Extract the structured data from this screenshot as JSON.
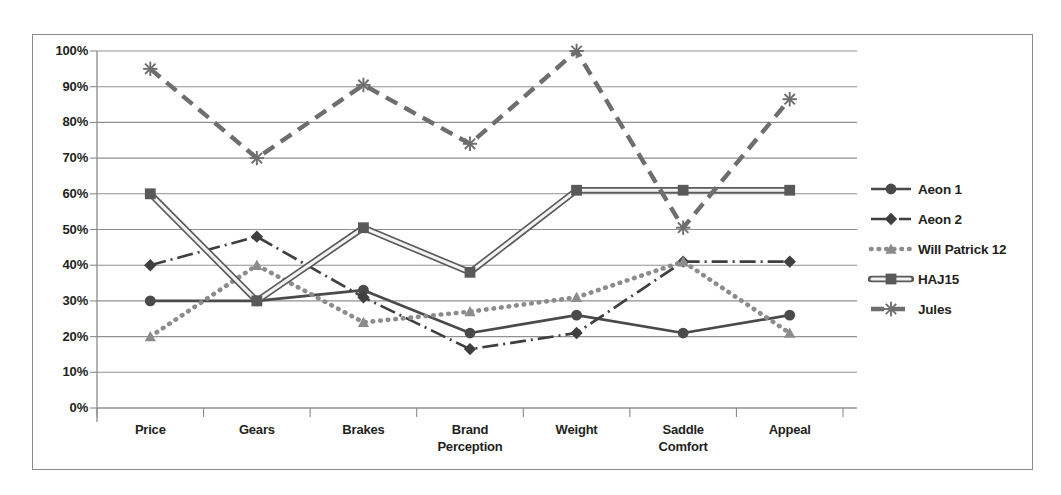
{
  "chart_data": {
    "type": "line",
    "title": "",
    "xlabel": "",
    "ylabel": "",
    "ylim": [
      0,
      100
    ],
    "grid": true,
    "legend_position": "right",
    "categories": [
      "Price",
      "Gears",
      "Brakes",
      "Brand\nPerception",
      "Weight",
      "Saddle\nComfort",
      "Appeal"
    ],
    "ytick_labels": [
      "100%",
      "90%",
      "80%",
      "70%",
      "60%",
      "50%",
      "40%",
      "30%",
      "20%",
      "10%",
      "0%"
    ],
    "ytick_values": [
      100,
      90,
      80,
      70,
      60,
      50,
      40,
      30,
      20,
      10,
      0
    ],
    "series": [
      {
        "name": "Aeon 1",
        "values": [
          30,
          30,
          33,
          21,
          26,
          21,
          26
        ],
        "marker": "circle",
        "dash": "solid",
        "color": "#4a4a4a"
      },
      {
        "name": "Aeon 2",
        "values": [
          40,
          48,
          31,
          16.5,
          21,
          41,
          41
        ],
        "marker": "diamond",
        "dash": "dash-dot",
        "color": "#3f3f3f"
      },
      {
        "name": "Will Patrick 12",
        "values": [
          20,
          40,
          24,
          27,
          31,
          41,
          21
        ],
        "marker": "triangle",
        "dash": "dotted",
        "color": "#8c8c8c"
      },
      {
        "name": "HAJ15",
        "values": [
          60,
          30,
          50.5,
          38,
          61,
          61,
          61
        ],
        "marker": "square",
        "dash": "solid-outline",
        "color": "#595959"
      },
      {
        "name": "Jules",
        "values": [
          95,
          70,
          90.5,
          74,
          100,
          50.5,
          86.5
        ],
        "marker": "asterisk",
        "dash": "dashed",
        "color": "#6e6e6e"
      }
    ]
  },
  "legend": {
    "items": [
      {
        "label": "Aeon 1"
      },
      {
        "label": "Aeon 2"
      },
      {
        "label": "Will Patrick 12"
      },
      {
        "label": "HAJ15"
      },
      {
        "label": "Jules"
      }
    ]
  },
  "colors": {
    "axis": "#8a8a8a",
    "grid": "#909090",
    "border": "#8a8a8a",
    "text": "#231f20",
    "background": "#ffffff"
  }
}
